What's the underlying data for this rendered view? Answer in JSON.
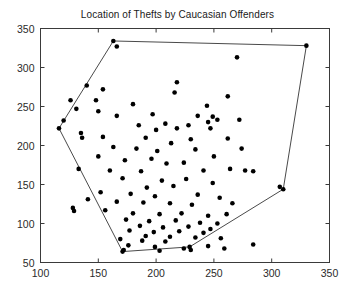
{
  "chart_data": {
    "type": "scatter",
    "title": "Location of Thefts by Caucasian Offenders",
    "xlabel": "",
    "ylabel": "",
    "xlim": [
      100,
      350
    ],
    "ylim": [
      50,
      350
    ],
    "xticks": [
      100,
      150,
      200,
      250,
      300,
      350
    ],
    "yticks": [
      50,
      100,
      150,
      200,
      250,
      300,
      350
    ],
    "grid": false,
    "legend": null,
    "marker": {
      "shape": "circle",
      "color": "#000000",
      "size": 2.3
    },
    "hull": {
      "label": "convex-hull",
      "color": "#4a4a4a",
      "width": 1,
      "points": [
        [
          116,
          222
        ],
        [
          163,
          334
        ],
        [
          330,
          328
        ],
        [
          310,
          144
        ],
        [
          229,
          70
        ],
        [
          171,
          64
        ]
      ]
    },
    "points": [
      [
        166,
        327
      ],
      [
        270,
        313
      ],
      [
        140,
        277
      ],
      [
        218,
        281
      ],
      [
        154,
        272
      ],
      [
        216,
        268
      ],
      [
        126,
        258
      ],
      [
        148,
        258
      ],
      [
        262,
        263
      ],
      [
        180,
        253
      ],
      [
        131,
        247
      ],
      [
        244,
        251
      ],
      [
        150,
        244
      ],
      [
        197,
        240
      ],
      [
        166,
        238
      ],
      [
        120,
        232
      ],
      [
        236,
        238
      ],
      [
        249,
        237
      ],
      [
        253,
        233
      ],
      [
        245,
        230
      ],
      [
        208,
        228
      ],
      [
        185,
        226
      ],
      [
        228,
        226
      ],
      [
        272,
        233
      ],
      [
        218,
        222
      ],
      [
        200,
        220
      ],
      [
        247,
        222
      ],
      [
        135,
        216
      ],
      [
        136,
        210
      ],
      [
        154,
        211
      ],
      [
        191,
        210
      ],
      [
        230,
        208
      ],
      [
        262,
        209
      ],
      [
        213,
        203
      ],
      [
        163,
        198
      ],
      [
        183,
        196
      ],
      [
        201,
        193
      ],
      [
        234,
        195
      ],
      [
        274,
        196
      ],
      [
        150,
        186
      ],
      [
        173,
        181
      ],
      [
        196,
        183
      ],
      [
        250,
        186
      ],
      [
        209,
        177
      ],
      [
        224,
        178
      ],
      [
        133,
        170
      ],
      [
        160,
        168
      ],
      [
        187,
        167
      ],
      [
        241,
        168
      ],
      [
        264,
        170
      ],
      [
        277,
        168
      ],
      [
        284,
        167
      ],
      [
        171,
        158
      ],
      [
        205,
        155
      ],
      [
        226,
        157
      ],
      [
        249,
        152
      ],
      [
        215,
        148
      ],
      [
        192,
        146
      ],
      [
        307,
        147
      ],
      [
        152,
        140
      ],
      [
        178,
        138
      ],
      [
        199,
        135
      ],
      [
        236,
        137
      ],
      [
        255,
        133
      ],
      [
        141,
        131
      ],
      [
        166,
        128
      ],
      [
        189,
        127
      ],
      [
        212,
        126
      ],
      [
        231,
        124
      ],
      [
        266,
        126
      ],
      [
        128,
        120
      ],
      [
        129,
        116
      ],
      [
        156,
        117
      ],
      [
        180,
        113
      ],
      [
        203,
        112
      ],
      [
        222,
        113
      ],
      [
        245,
        110
      ],
      [
        261,
        112
      ],
      [
        174,
        105
      ],
      [
        194,
        103
      ],
      [
        217,
        104
      ],
      [
        238,
        101
      ],
      [
        253,
        100
      ],
      [
        186,
        97
      ],
      [
        206,
        95
      ],
      [
        228,
        96
      ],
      [
        247,
        93
      ],
      [
        177,
        91
      ],
      [
        198,
        89
      ],
      [
        220,
        90
      ],
      [
        241,
        88
      ],
      [
        191,
        84
      ],
      [
        212,
        83
      ],
      [
        234,
        82
      ],
      [
        169,
        80
      ],
      [
        188,
        78
      ],
      [
        208,
        77
      ],
      [
        256,
        81
      ],
      [
        176,
        72
      ],
      [
        199,
        70
      ],
      [
        224,
        68
      ],
      [
        245,
        71
      ],
      [
        172,
        66
      ],
      [
        203,
        65
      ],
      [
        230,
        66
      ],
      [
        259,
        68
      ],
      [
        284,
        73
      ]
    ]
  }
}
